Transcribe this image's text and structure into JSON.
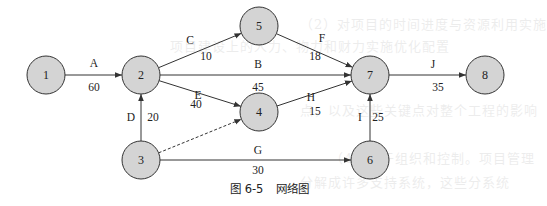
{
  "figure": {
    "caption_number": "图 6-5",
    "caption_title": "网络图"
  },
  "nodes": [
    {
      "id": "1",
      "label": "1",
      "cx": 46,
      "cy": 75
    },
    {
      "id": "2",
      "label": "2",
      "cx": 141,
      "cy": 75
    },
    {
      "id": "3",
      "label": "3",
      "cx": 141,
      "cy": 160
    },
    {
      "id": "4",
      "label": "4",
      "cx": 259,
      "cy": 112
    },
    {
      "id": "5",
      "label": "5",
      "cx": 259,
      "cy": 26
    },
    {
      "id": "6",
      "label": "6",
      "cx": 370,
      "cy": 160
    },
    {
      "id": "7",
      "label": "7",
      "cx": 370,
      "cy": 75
    },
    {
      "id": "8",
      "label": "8",
      "cx": 485,
      "cy": 75
    }
  ],
  "edges": [
    {
      "activity": "A",
      "duration": "60",
      "from": "1",
      "to": "2",
      "dashed": false
    },
    {
      "activity": "C",
      "duration": "10",
      "from": "2",
      "to": "5",
      "dashed": false
    },
    {
      "activity": "B",
      "duration": "45",
      "from": "2",
      "to": "7",
      "dashed": false
    },
    {
      "activity": "E",
      "duration": "40",
      "from": "2",
      "to": "4",
      "dashed": false
    },
    {
      "activity": "D",
      "duration": "20",
      "from": "3",
      "to": "2",
      "dashed": false
    },
    {
      "activity": "",
      "duration": "",
      "from": "3",
      "to": "4",
      "dashed": true
    },
    {
      "activity": "G",
      "duration": "30",
      "from": "3",
      "to": "6",
      "dashed": false
    },
    {
      "activity": "F",
      "duration": "18",
      "from": "5",
      "to": "7",
      "dashed": false
    },
    {
      "activity": "H",
      "duration": "15",
      "from": "4",
      "to": "7",
      "dashed": false
    },
    {
      "activity": "I",
      "duration": "25",
      "from": "6",
      "to": "7",
      "dashed": false
    },
    {
      "activity": "J",
      "duration": "35",
      "from": "7",
      "to": "8",
      "dashed": false
    }
  ],
  "style": {
    "node_fill": "#d4d4d4",
    "stroke": "#333333",
    "node_radius": 19
  }
}
